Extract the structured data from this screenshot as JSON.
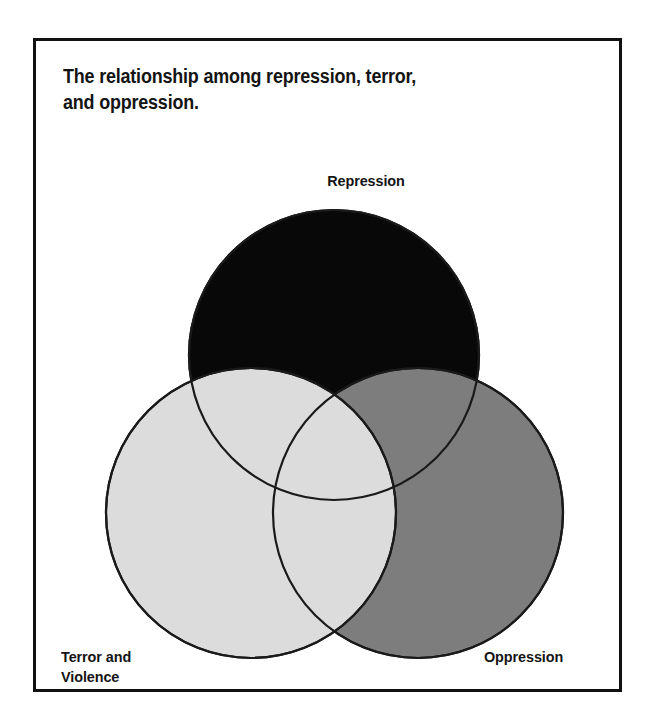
{
  "figure": {
    "title": "The relationship among repression, terror,\nand oppression.",
    "diagram_type": "venn-diagram-3-set",
    "background_color": "#ffffff",
    "frame_color": "#111111",
    "outline_color": "#1a1a1a",
    "sets": [
      {
        "id": "repression",
        "label": "Repression",
        "fill_color": "#080808",
        "label_position": "top",
        "draw_order": 1,
        "center_x": 331,
        "center_y": 352,
        "radius": 145
      },
      {
        "id": "oppression",
        "label": "Oppression",
        "fill_color": "#7d7d7d",
        "label_position": "bottom-right",
        "draw_order": 2,
        "center_x": 415,
        "center_y": 510,
        "radius": 145
      },
      {
        "id": "terror-and-violence",
        "label": "Terror and\nViolence",
        "fill_color": "#dcdcdc",
        "label_position": "bottom-left",
        "draw_order": 3,
        "center_x": 248,
        "center_y": 510,
        "radius": 145
      }
    ]
  }
}
